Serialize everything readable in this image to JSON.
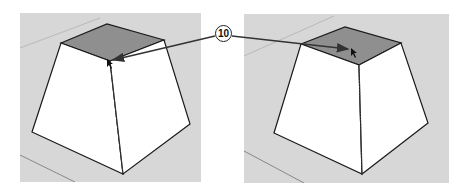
{
  "figure": {
    "callout_label": "10",
    "panels": [
      {
        "id": "left",
        "description": "Pyramid frustum, cursor near front corner of top face"
      },
      {
        "id": "right",
        "description": "Pyramid frustum, cursor in middle of top face"
      }
    ]
  },
  "colors": {
    "background": "#ffffff",
    "viewport": "#d7d7d7",
    "top_face": "#8f8f8f",
    "side_face": "#ffffff",
    "edge": "#1a1a1a",
    "arrow": "#333333"
  }
}
